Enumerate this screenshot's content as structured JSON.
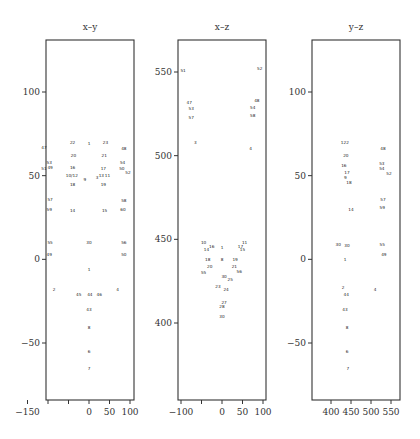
{
  "chart_data": [
    {
      "type": "scatter",
      "title": "x–y",
      "xlabel": "",
      "ylabel": "",
      "xlim": [
        -155,
        105
      ],
      "ylim": [
        -75,
        132
      ],
      "xticks": [
        -150,
        -100,
        -50,
        0,
        50,
        100
      ],
      "xtick_labels": [
        "−150",
        "",
        "",
        "0",
        "50",
        "100"
      ],
      "yticks": [
        100,
        50,
        0,
        -50
      ],
      "ytick_labels": [
        "100",
        "50",
        "0",
        "−50"
      ],
      "grid": false,
      "points": [
        {
          "label": "22",
          "x": -40,
          "y": 70
        },
        {
          "label": "1",
          "x": 0,
          "y": 69
        },
        {
          "label": "23",
          "x": 40,
          "y": 70
        },
        {
          "label": "47",
          "x": -110,
          "y": 67
        },
        {
          "label": "48",
          "x": 85,
          "y": 66
        },
        {
          "label": "20",
          "x": -38,
          "y": 62
        },
        {
          "label": "21",
          "x": 37,
          "y": 62
        },
        {
          "label": "53",
          "x": -97,
          "y": 58
        },
        {
          "label": "54",
          "x": 82,
          "y": 58
        },
        {
          "label": "51",
          "x": -110,
          "y": 54
        },
        {
          "label": "49",
          "x": -95,
          "y": 55
        },
        {
          "label": "16",
          "x": -40,
          "y": 55
        },
        {
          "label": "17",
          "x": 35,
          "y": 54
        },
        {
          "label": "50",
          "x": 80,
          "y": 54
        },
        {
          "label": "52",
          "x": 95,
          "y": 52
        },
        {
          "label": "10/12",
          "x": -42,
          "y": 50
        },
        {
          "label": "13",
          "x": 30,
          "y": 50
        },
        {
          "label": "11",
          "x": 45,
          "y": 50
        },
        {
          "label": "3",
          "x": 20,
          "y": 49
        },
        {
          "label": "9",
          "x": -10,
          "y": 48
        },
        {
          "label": "18",
          "x": -40,
          "y": 45
        },
        {
          "label": "19",
          "x": 35,
          "y": 45
        },
        {
          "label": "57",
          "x": -95,
          "y": 36
        },
        {
          "label": "58",
          "x": 85,
          "y": 35
        },
        {
          "label": "59",
          "x": -97,
          "y": 30
        },
        {
          "label": "60",
          "x": 83,
          "y": 30
        },
        {
          "label": "14",
          "x": -40,
          "y": 29
        },
        {
          "label": "15",
          "x": 38,
          "y": 29
        },
        {
          "label": "55",
          "x": -95,
          "y": 10
        },
        {
          "label": "56",
          "x": 85,
          "y": 10
        },
        {
          "label": "30",
          "x": 0,
          "y": 10
        },
        {
          "label": "49",
          "x": -97,
          "y": 3
        },
        {
          "label": "50",
          "x": 85,
          "y": 3
        },
        {
          "label": "1",
          "x": 0,
          "y": -6
        },
        {
          "label": "2",
          "x": -85,
          "y": -18
        },
        {
          "label": "4",
          "x": 70,
          "y": -18
        },
        {
          "label": "45",
          "x": -25,
          "y": -21
        },
        {
          "label": "44",
          "x": 2,
          "y": -21
        },
        {
          "label": "46",
          "x": 25,
          "y": -21
        },
        {
          "label": "43",
          "x": 0,
          "y": -30
        },
        {
          "label": "8",
          "x": 0,
          "y": -41
        },
        {
          "label": "6",
          "x": 0,
          "y": -55
        },
        {
          "label": "7",
          "x": 0,
          "y": -65
        }
      ]
    },
    {
      "type": "scatter",
      "title": "x–z",
      "xlabel": "",
      "ylabel": "",
      "xlim": [
        -105,
        105
      ],
      "ylim": [
        370,
        570
      ],
      "xticks": [
        -100,
        -50,
        0,
        50,
        100
      ],
      "xtick_labels": [
        "−100",
        "",
        "0",
        "50",
        "100"
      ],
      "yticks": [
        550,
        500,
        450,
        400
      ],
      "ytick_labels": [
        "550",
        "500",
        "450",
        "400"
      ],
      "grid": false,
      "points": [
        {
          "label": "51",
          "x": -95,
          "y": 551
        },
        {
          "label": "52",
          "x": 92,
          "y": 552
        },
        {
          "label": "47",
          "x": -80,
          "y": 532
        },
        {
          "label": "48",
          "x": 85,
          "y": 533
        },
        {
          "label": "53",
          "x": -75,
          "y": 528
        },
        {
          "label": "54",
          "x": 75,
          "y": 529
        },
        {
          "label": "57",
          "x": -75,
          "y": 523
        },
        {
          "label": "58",
          "x": 75,
          "y": 524
        },
        {
          "label": "3",
          "x": -65,
          "y": 508
        },
        {
          "label": "4",
          "x": 70,
          "y": 504
        },
        {
          "label": "10",
          "x": -45,
          "y": 448
        },
        {
          "label": "11",
          "x": 55,
          "y": 448
        },
        {
          "label": "14",
          "x": -38,
          "y": 444
        },
        {
          "label": "16",
          "x": -25,
          "y": 446
        },
        {
          "label": "17",
          "x": 45,
          "y": 446
        },
        {
          "label": "15",
          "x": 50,
          "y": 444
        },
        {
          "label": "1",
          "x": 0,
          "y": 445
        },
        {
          "label": "18",
          "x": -35,
          "y": 438
        },
        {
          "label": "8",
          "x": 0,
          "y": 438
        },
        {
          "label": "19",
          "x": 32,
          "y": 438
        },
        {
          "label": "20",
          "x": -30,
          "y": 434
        },
        {
          "label": "21",
          "x": 30,
          "y": 434
        },
        {
          "label": "55",
          "x": -45,
          "y": 430
        },
        {
          "label": "56",
          "x": 42,
          "y": 431
        },
        {
          "label": "30",
          "x": 5,
          "y": 428
        },
        {
          "label": "25",
          "x": 20,
          "y": 426
        },
        {
          "label": "23",
          "x": -10,
          "y": 422
        },
        {
          "label": "24",
          "x": 10,
          "y": 420
        },
        {
          "label": "27",
          "x": 5,
          "y": 412
        },
        {
          "label": "28",
          "x": 0,
          "y": 410
        },
        {
          "label": "30",
          "x": 0,
          "y": 404
        }
      ]
    },
    {
      "type": "scatter",
      "title": "y–z",
      "xlabel": "",
      "ylabel": "",
      "xlim": [
        375,
        560
      ],
      "ylim": [
        -75,
        132
      ],
      "xticks": [
        400,
        450,
        500,
        550
      ],
      "xtick_labels": [
        "400",
        "450",
        "500",
        "550"
      ],
      "yticks": [
        100,
        50,
        0,
        -50
      ],
      "ytick_labels": [
        "100",
        "50",
        "0",
        "−50"
      ],
      "grid": false,
      "points": [
        {
          "label": "1",
          "x": 428,
          "y": 70
        },
        {
          "label": "22",
          "x": 438,
          "y": 70
        },
        {
          "label": "48",
          "x": 530,
          "y": 66
        },
        {
          "label": "20",
          "x": 437,
          "y": 62
        },
        {
          "label": "53",
          "x": 527,
          "y": 57
        },
        {
          "label": "54",
          "x": 527,
          "y": 54
        },
        {
          "label": "52",
          "x": 545,
          "y": 51
        },
        {
          "label": "16",
          "x": 432,
          "y": 56
        },
        {
          "label": "17",
          "x": 440,
          "y": 52
        },
        {
          "label": "9",
          "x": 436,
          "y": 49
        },
        {
          "label": "18",
          "x": 445,
          "y": 46
        },
        {
          "label": "57",
          "x": 530,
          "y": 36
        },
        {
          "label": "59",
          "x": 528,
          "y": 31
        },
        {
          "label": "14",
          "x": 450,
          "y": 30
        },
        {
          "label": "30",
          "x": 418,
          "y": 9
        },
        {
          "label": "30",
          "x": 440,
          "y": 8
        },
        {
          "label": "55",
          "x": 528,
          "y": 9
        },
        {
          "label": "49",
          "x": 532,
          "y": 3
        },
        {
          "label": "1",
          "x": 435,
          "y": 0
        },
        {
          "label": "2",
          "x": 430,
          "y": -17
        },
        {
          "label": "4",
          "x": 510,
          "y": -18
        },
        {
          "label": "44",
          "x": 438,
          "y": -21
        },
        {
          "label": "43",
          "x": 435,
          "y": -30
        },
        {
          "label": "8",
          "x": 440,
          "y": -41
        },
        {
          "label": "6",
          "x": 440,
          "y": -55
        },
        {
          "label": "7",
          "x": 442,
          "y": -65
        }
      ]
    }
  ],
  "panels": [
    {
      "title": "x–y"
    },
    {
      "title": "x–z"
    },
    {
      "title": "y–z"
    }
  ]
}
